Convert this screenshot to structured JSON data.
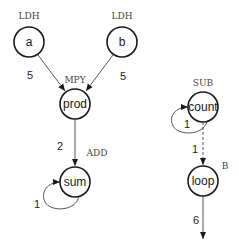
{
  "diagram": {
    "nodes": [
      {
        "id": "a",
        "label": "a",
        "op": "LDH",
        "cx": 29,
        "cy": 42
      },
      {
        "id": "b",
        "label": "b",
        "op": "LDH",
        "cx": 122,
        "cy": 42
      },
      {
        "id": "prod",
        "label": "prod",
        "op": "MPY",
        "cx": 75,
        "cy": 104
      },
      {
        "id": "sum",
        "label": "sum",
        "op": "ADD",
        "cx": 75,
        "cy": 182
      },
      {
        "id": "count",
        "label": "count",
        "op": "SUB",
        "cx": 203,
        "cy": 107
      },
      {
        "id": "loop",
        "label": "loop",
        "op": "B",
        "cx": 203,
        "cy": 181
      }
    ],
    "edges": [
      {
        "from": "a",
        "to": "prod",
        "weight": "5",
        "style": "solid"
      },
      {
        "from": "b",
        "to": "prod",
        "weight": "5",
        "style": "solid"
      },
      {
        "from": "prod",
        "to": "sum",
        "weight": "2",
        "style": "solid"
      },
      {
        "from": "sum",
        "to": "sum",
        "weight": "1",
        "style": "self-loop"
      },
      {
        "from": "count",
        "to": "count",
        "weight": "1",
        "style": "self-loop"
      },
      {
        "from": "count",
        "to": "loop",
        "weight": "1",
        "style": "dashed"
      },
      {
        "from": "loop",
        "to": "exit",
        "weight": "6",
        "style": "solid"
      }
    ]
  }
}
